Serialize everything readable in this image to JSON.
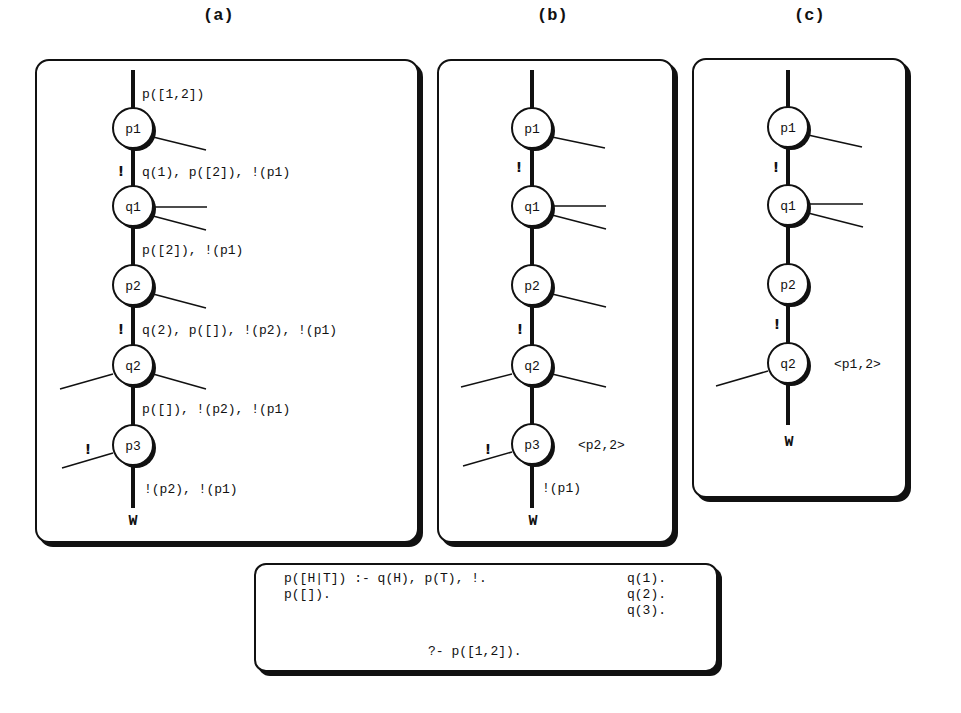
{
  "panels": {
    "a": {
      "title": "(a)",
      "labels": {
        "top": "p([1,2])",
        "e1": "q(1), p([2]), !(p1)",
        "e2": "p([2]), !(p1)",
        "e3": "q(2), p([]), !(p2), !(p1)",
        "e4": "p([]), !(p2), !(p1)",
        "e5": "!(p2), !(p1)"
      },
      "nodes": [
        "p1",
        "q1",
        "p2",
        "q2",
        "p3"
      ],
      "cut_marks": [
        "!",
        "!",
        "!"
      ],
      "terminal": "W"
    },
    "b": {
      "title": "(b)",
      "nodes": [
        "p1",
        "q1",
        "p2",
        "q2",
        "p3"
      ],
      "cut_marks": [
        "!",
        "!",
        "!"
      ],
      "annotation": "<p2,2>",
      "bottom_label": "!(p1)",
      "terminal": "W"
    },
    "c": {
      "title": "(c)",
      "nodes": [
        "p1",
        "q1",
        "p2",
        "q2"
      ],
      "cut_marks": [
        "!",
        "!"
      ],
      "annotation": "<p1,2>",
      "terminal": "W"
    }
  },
  "program": {
    "clause1": "p([H|T]) :- q(H), p(T), !.",
    "clause2": "p([]).",
    "facts": [
      "q(1).",
      "q(2).",
      "q(3)."
    ],
    "query": "?- p([1,2])."
  }
}
